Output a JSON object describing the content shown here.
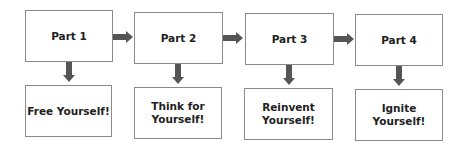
{
  "diagram": {
    "parts": [
      {
        "label": "Part 1",
        "outcome": "Free Yourself!"
      },
      {
        "label": "Part 2",
        "outcome": "Think for Yourself!"
      },
      {
        "label": "Part 3",
        "outcome": "Reinvent Yourself!"
      },
      {
        "label": "Part 4",
        "outcome": "Ignite Yourself!"
      }
    ],
    "colors": {
      "border": "#8a8a8a",
      "arrow": "#555555",
      "text": "#222222"
    }
  }
}
